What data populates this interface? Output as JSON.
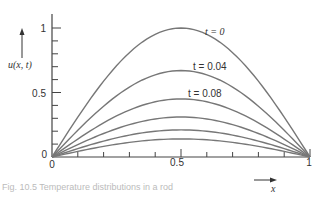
{
  "chart_data": {
    "type": "line",
    "title": "",
    "xlabel": "x",
    "ylabel": "u(x, t)",
    "xlim": [
      0,
      1
    ],
    "ylim": [
      0,
      1
    ],
    "x_ticks": [
      "0",
      "0.5",
      "1"
    ],
    "y_ticks": [
      "0",
      "0.5",
      "1"
    ],
    "grid": false,
    "x": [
      0,
      0.1,
      0.2,
      0.3,
      0.4,
      0.5,
      0.6,
      0.7,
      0.8,
      0.9,
      1.0
    ],
    "series": [
      {
        "name": "t = 0",
        "peak": 1.0
      },
      {
        "name": "t = 0.04",
        "peak": 0.67
      },
      {
        "name": "t = 0.08",
        "peak": 0.45
      },
      {
        "name": "",
        "peak": 0.31
      },
      {
        "name": "",
        "peak": 0.21
      },
      {
        "name": "",
        "peak": 0.14
      }
    ],
    "annotations": [
      "t = 0",
      "t = 0.04",
      "t = 0.08"
    ]
  },
  "axes": {
    "y_label": "u(x, t)",
    "x_label": "x",
    "y_tick_1": "1",
    "y_tick_05": "0.5",
    "y_tick_0": "0",
    "x_tick_0": "0",
    "x_tick_05": "0.5",
    "x_tick_1": "1"
  },
  "labels": {
    "t0": "t = 0",
    "t004": "t = 0.04",
    "t008": "t = 0.08"
  },
  "caption": "Fig. 10.5  Temperature distributions in a rod"
}
